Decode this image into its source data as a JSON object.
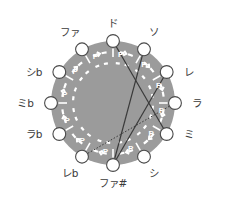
{
  "figure": {
    "type": "diagram",
    "background_color": "#ffffff",
    "disc_color": "#9b9b9b",
    "node_fill": "#ffffff",
    "node_stroke": "#4a4a4a",
    "arc_color": "#ffffff",
    "chord_color": "#3a3a3a",
    "label_color": "#3b3b3b",
    "center": {
      "x": 113,
      "y": 103
    },
    "radius": 62,
    "node_radius": 6.4
  },
  "nodes": [
    {
      "id": "do",
      "label": "ド",
      "angle_deg": -90,
      "label_pos": "top",
      "p": "P"
    },
    {
      "id": "so",
      "label": "ソ",
      "angle_deg": -60,
      "label_pos": "top-right",
      "p": "P"
    },
    {
      "id": "re",
      "label": "レ",
      "angle_deg": -30,
      "label_pos": "right",
      "p": "P"
    },
    {
      "id": "la",
      "label": "ラ",
      "angle_deg": 0,
      "label_pos": "right",
      "p": "P"
    },
    {
      "id": "mi",
      "label": "ミ",
      "angle_deg": 30,
      "label_pos": "right",
      "p": "P"
    },
    {
      "id": "si",
      "label": "シ",
      "angle_deg": 60,
      "label_pos": "bottom-right",
      "p": "P"
    },
    {
      "id": "fa-sharp",
      "label": "ファ#",
      "angle_deg": 90,
      "label_pos": "bottom",
      "p": "P"
    },
    {
      "id": "re-flat",
      "label": "レb",
      "angle_deg": 120,
      "label_pos": "bottom-left",
      "p": "P"
    },
    {
      "id": "la-flat",
      "label": "ラb",
      "angle_deg": 150,
      "label_pos": "left",
      "p": "P"
    },
    {
      "id": "mi-flat",
      "label": "ミb",
      "angle_deg": 180,
      "label_pos": "left",
      "p": "P"
    },
    {
      "id": "si-flat",
      "label": "シb",
      "angle_deg": 210,
      "label_pos": "left",
      "p": "P"
    },
    {
      "id": "fa",
      "label": "ファ",
      "angle_deg": 240,
      "label_pos": "top-left",
      "p": "P"
    }
  ],
  "chords": [
    {
      "from": "do",
      "to": "mi",
      "style": "solid"
    },
    {
      "from": "so",
      "to": "fa-sharp",
      "style": "solid"
    },
    {
      "from": "re",
      "to": "fa-sharp",
      "style": "solid"
    },
    {
      "from": "la",
      "to": "re-flat",
      "style": "dotted"
    }
  ],
  "arc_label": "P",
  "arc_count": 12
}
